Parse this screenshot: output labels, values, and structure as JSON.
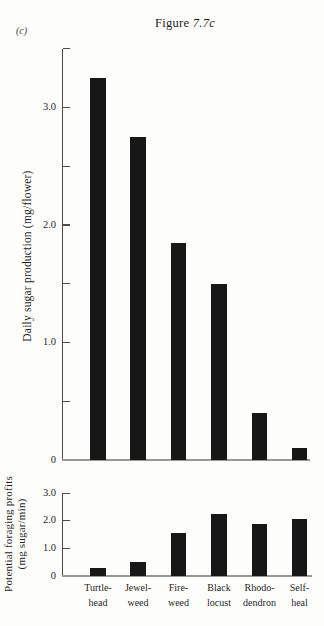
{
  "figure": {
    "corner_label": "(c)",
    "title_prefix": "Figure ",
    "title_suffix": "7.7c"
  },
  "chart_data": [
    {
      "type": "bar",
      "id": "daily-sugar-production",
      "title": "Figure 7.7c",
      "ylabel": "Daily sugar production (mg/flower)",
      "ylabel_lines": [
        "Daily sugar production (mg/flower)"
      ],
      "xlabel": "",
      "categories": [
        "Turtle-head",
        "Jewel-weed",
        "Fire-weed",
        "Black locust",
        "Rhododendron",
        "Self-heal"
      ],
      "values": [
        3.25,
        2.75,
        1.85,
        1.5,
        0.4,
        0.1
      ],
      "ylim": [
        0,
        3.5
      ],
      "yticks": [
        {
          "v": 0,
          "label": "0"
        },
        {
          "v": 0.5,
          "label": ""
        },
        {
          "v": 1,
          "label": "1.0"
        },
        {
          "v": 1.5,
          "label": ""
        },
        {
          "v": 2,
          "label": "2.0"
        },
        {
          "v": 2.5,
          "label": ""
        },
        {
          "v": 3,
          "label": "3.0"
        },
        {
          "v": 3.5,
          "label": ""
        }
      ],
      "grid": false,
      "legend_position": "none",
      "bar_color": "#171717"
    },
    {
      "type": "bar",
      "id": "potential-foraging-profits",
      "ylabel": "Potential foraging profits (mg sugar/min)",
      "ylabel_lines": [
        "Potential foraging profits",
        "(mg sugar/min)"
      ],
      "xlabel": "",
      "categories": [
        "Turtle-head",
        "Jewel-weed",
        "Fire-weed",
        "Black locust",
        "Rhododendron",
        "Self-heal"
      ],
      "values": [
        0.3,
        0.5,
        1.55,
        2.25,
        1.9,
        2.05
      ],
      "ylim": [
        0,
        3.0
      ],
      "yticks": [
        {
          "v": 0,
          "label": "0"
        },
        {
          "v": 1,
          "label": "1.0"
        },
        {
          "v": 2,
          "label": "2.0"
        },
        {
          "v": 3,
          "label": "3.0"
        }
      ],
      "grid": false,
      "legend_position": "none",
      "bar_color": "#171717"
    }
  ],
  "category_label_lines": [
    [
      "Turtle-",
      "head"
    ],
    [
      "Jewel-",
      "weed"
    ],
    [
      "Fire-",
      "weed"
    ],
    [
      "Black",
      "locust"
    ],
    [
      "Rhodo-",
      "dendron"
    ],
    [
      "Self-",
      "heal"
    ]
  ],
  "colors": {
    "bar": "#171717",
    "axis": "#4d4d4d",
    "baseline": "#989898",
    "text": "#222222",
    "background": "#fdfdfc"
  }
}
